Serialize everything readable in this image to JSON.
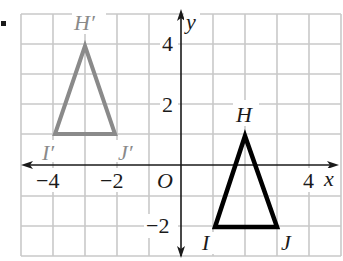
{
  "bullet": "▪",
  "colors": {
    "grid": "#c9c9c9",
    "axis": "#1a1a1a",
    "preimage": "#000000",
    "image": "#8a8a8a",
    "background": "#ffffff"
  },
  "axes": {
    "x_label": "x",
    "y_label": "y",
    "origin_label": "O",
    "x_range": [
      -5,
      5
    ],
    "y_range": [
      -3,
      5
    ],
    "x_ticks": [
      {
        "value": -4,
        "label": "−4"
      },
      {
        "value": -2,
        "label": "−2"
      },
      {
        "value": 4,
        "label": "4"
      }
    ],
    "y_ticks": [
      {
        "value": 4,
        "label": "4"
      },
      {
        "value": 2,
        "label": "2"
      },
      {
        "value": -2,
        "label": "−2"
      }
    ],
    "grid": true
  },
  "triangles": {
    "preimage": {
      "name": "HIJ",
      "vertices": [
        {
          "label": "H",
          "x": 2,
          "y": 1
        },
        {
          "label": "I",
          "x": 1,
          "y": -2
        },
        {
          "label": "J",
          "x": 3,
          "y": -2
        }
      ]
    },
    "image": {
      "name": "H'I'J'",
      "vertices": [
        {
          "label": "H′",
          "x": -3,
          "y": 4
        },
        {
          "label": "I′",
          "x": -4,
          "y": 1
        },
        {
          "label": "J′",
          "x": -2,
          "y": 1
        }
      ]
    }
  }
}
